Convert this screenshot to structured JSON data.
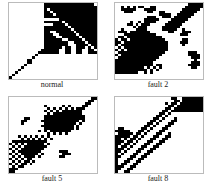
{
  "chart_data": [
    {
      "type": "heatmap",
      "title": "normal",
      "xlabel": "",
      "ylabel": "",
      "grid_size": 30,
      "tick_labels": [
        "5",
        "10",
        "15",
        "20",
        "25",
        "30"
      ],
      "rows": [
        "00000000000011111111111111111",
        "000000000000111111111111111111",
        "000000000000101111111111111111",
        "000000000000110111111111111111",
        "000000000000111011111111111111",
        "000000000000111111111111111111",
        "000000000000000001111111111111",
        "000000000000111111011111111111",
        "000000000000000111101111111111",
        "000000000000111111110111111111",
        "000000000000111111111011111111",
        "000000000000110011111101111111",
        "000000000000111001111110111111",
        "000000000000111100111111011111",
        "000000000000111111001111101111",
        "000000000000111111110011110111",
        "000000000000111111110001111011",
        "000000000000111111011001110101",
        "000000000001111110011001100110",
        "000000000011111110011001100111",
        "000000000100000000000000000000",
        "000000001000000000000000000000",
        "000000110000000000000000000000",
        "000000110000000000000000000000",
        "000001000000000000000000000000",
        "000010000000000000000000000000",
        "000100000000000000000000000000",
        "001000000000000000000000000000",
        "010000000000000000000000000000",
        "100000000000000000000000000000"
      ]
    },
    {
      "type": "heatmap",
      "title": "fault 2",
      "xlabel": "",
      "ylabel": "",
      "grid_size": 30,
      "tick_labels": [
        "5",
        "10",
        "15",
        "20",
        "25",
        "30"
      ],
      "rows": [
        "000000000000000000000000011111",
        "001010101100110000000000111111",
        "001111100011110000000001111110",
        "000111000001100110000011111100",
        "000000000000000111100111111000",
        "000000000001110011101111110000",
        "000000000011111000011111100000",
        "000001001011110000111111000000",
        "000011010111000001111110000000",
        "000000101110000011111100000000",
        "001000011110000011111001000000",
        "011101111111000000110001110000",
        "000111111111110000000011100000",
        "011011111111111100000000000000",
        "101101111111111110000001100000",
        "110111111111111111000011100000",
        "101111111111111111000001000000",
        "010111111111111111000000000000",
        "101011111111111111000000000000",
        "011111111111111110000000011100",
        "101111111111111100000000011110",
        "011111111111111000000000001110",
        "111111111111110000000000000100",
        "111111111111100000000000001110",
        "111111111111101100000000011110",
        "111111111101010100000000001100",
        "111111111110101000000000000000",
        "111111110010100000000000000000",
        "000000000000000000000000000000",
        "000000000000000000000000000000"
      ]
    },
    {
      "type": "heatmap",
      "title": "fault 5",
      "xlabel": "",
      "ylabel": "",
      "grid_size": 30,
      "tick_labels": [
        "5",
        "10",
        "15",
        "20",
        "25",
        "30"
      ],
      "rows": [
        "000000000000000000000000000011",
        "000000000000000000000000000110",
        "000000000000000000000000001100",
        "000000000000100000101000011000",
        "000000000000010101010101110000",
        "000000000000101010111111100000",
        "000000000000010111111111100000",
        "000000000000111111111111110000",
        "000001100000111111111111110000",
        "000011000001111111111111010000",
        "000010000000111111111110100000",
        "000000000001111111111101000000",
        "000000000000111111111101000000",
        "000000000010101111111000000000",
        "000000000000010101010000000000",
        "000101010101010000000000000000",
        "000010101010101000000000000000",
        "011111111111100000000000000000",
        "101010111111010000000000000000",
        "010101111111100000000000000000",
        "101011111111000000000000000000",
        "010111111110000001110000000000",
        "101011111101000000111000000000",
        "010101111010000001100000000000",
        "101010110000000000000000000000",
        "010101101000000000000000000000",
        "101011010000000000000000000000",
        "010110000000000000000000000000",
        "111000000000000000000000000000",
        "110000000000000000000000000000"
      ]
    },
    {
      "type": "heatmap",
      "title": "fault 8",
      "xlabel": "",
      "ylabel": "",
      "grid_size": 30,
      "tick_labels": [
        "5",
        "10",
        "15",
        "20",
        "25",
        "30"
      ],
      "rows": [
        "000000000000000000011001111111",
        "000000000000000000001101111111",
        "000000000000000001011011111111",
        "000000000000000000110111111111",
        "000000000000000001101111111111",
        "000000000000000011011111111111",
        "000000000000000110100000000000",
        "000000000000001101000000000000",
        "000000000000011010001000000000",
        "000000000000110100011000000000",
        "000000000001101000110000000000",
        "000000000011010001100000000000",
        "011000000110100011000000000000",
        "111110001101000110000000000000",
        "011111011010001100100000000000",
        "111110110100011001100000000000",
        "110101101000110011000000000000",
        "111011010001100110000000000000",
        "110110100011001100000000000000",
        "101101000110011000000000000000",
        "111010001100110000000000000000",
        "110100011001100000000000000000",
        "101000110011000000000000000000",
        "110001100110000000000000000000",
        "100011001100000000000000000000",
        "100110011000000000000000000000",
        "101100110000000000000000000000",
        "111001100000000000000000000000",
        "110011000000000000000000000000",
        "100110000000000000000000000000"
      ]
    }
  ],
  "captions": [
    "normal",
    "fault 2",
    "fault 5",
    "fault 8"
  ]
}
